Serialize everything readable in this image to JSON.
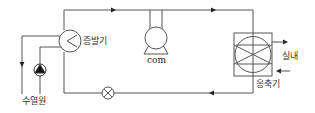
{
  "diagram": {
    "type": "heat-pump refrigeration cycle",
    "labels": {
      "evaporator": "증발기",
      "compressor": "com",
      "condenser": "응축기",
      "indoor": "실내",
      "water_source": "수열원"
    },
    "colors": {
      "line": "#555555",
      "background": "#ffffff"
    }
  }
}
